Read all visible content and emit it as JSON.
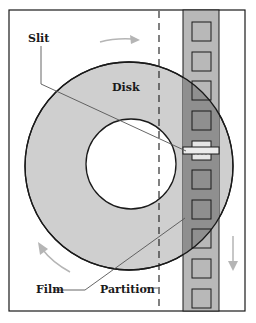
{
  "diagram": {
    "labels": {
      "slit": "Slit",
      "disk": "Disk",
      "film": "Film",
      "partition": "Partition"
    },
    "colors": {
      "disk_fill": "#cfcfcf",
      "film_fill": "#b8b8b8",
      "film_overlap_fill": "#8f8f8f",
      "frame_fill": "#c4c4c4",
      "arrow": "#b5b5b5",
      "stroke": "#1a1a1a"
    },
    "film_frames": 10
  }
}
